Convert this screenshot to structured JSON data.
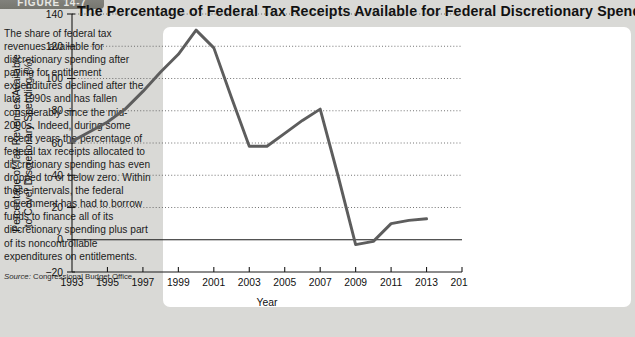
{
  "figure": {
    "tab_label": "FIGURE 14-7",
    "title": "The Percentage of Federal Tax Receipts Available for Federal Discretionary Spending"
  },
  "caption": {
    "body": "The share of federal tax revenues available for discretionary spending after paying for entitlement expenditures declined after the late 1990s and has fallen considerably since the mid-2000s. Indeed, during some recent years the percentage of federal tax receipts allocated to discretionary spending has even dropped to or below zero. Within these intervals, the federal government has had to borrow funds to finance all of its discretionary spending plus part of its noncontrollable expenditures on entitlements.",
    "source_label": "Source:",
    "source_value": "Congressional Budget Office."
  },
  "chart_data": {
    "type": "line",
    "title": "The Percentage of Federal Tax Receipts Available for Federal Discretionary Spending",
    "xlabel": "Year",
    "ylabel": "Percentage of Tax Revenues Available to Cover Discretionary Spending (%)",
    "ylabel_line1": "Percentage of Tax Revenues Available",
    "ylabel_line2": "to Cover Discretionary Spending (%)",
    "xlim": [
      1993,
      2015
    ],
    "ylim": [
      -20,
      140
    ],
    "yticks": [
      -20,
      0,
      20,
      40,
      60,
      80,
      100,
      120,
      140
    ],
    "ytick_labels": [
      "−20",
      "0",
      "20",
      "40",
      "60",
      "80",
      "100",
      "120",
      "140"
    ],
    "xticks": [
      1993,
      1995,
      1997,
      1999,
      2001,
      2003,
      2005,
      2007,
      2009,
      2011,
      2013,
      2015
    ],
    "xtick_labels": [
      "1993",
      "1995",
      "1997",
      "1999",
      "2001",
      "2003",
      "2005",
      "2007",
      "2009",
      "2011",
      "2013",
      "2015"
    ],
    "grid": "horizontal-dotted",
    "legend": "none",
    "line_color": "#5d5d5d",
    "series": [
      {
        "name": "Percentage of federal tax receipts available for discretionary spending",
        "x": [
          1993,
          1994,
          1995,
          1996,
          1997,
          1998,
          1999,
          2000,
          2001,
          2002,
          2003,
          2004,
          2005,
          2006,
          2007,
          2008,
          2009,
          2010,
          2011,
          2012,
          2013
        ],
        "values": [
          61,
          67,
          73,
          81,
          92,
          104,
          115,
          130,
          119,
          88,
          58,
          58,
          66,
          74,
          81,
          40,
          -3,
          -1,
          10,
          12,
          13
        ]
      }
    ]
  }
}
